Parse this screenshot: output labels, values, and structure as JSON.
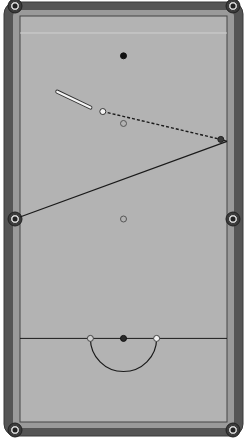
{
  "diagram": {
    "colors": {
      "background": "#ffffff",
      "rail": "#555555",
      "rail_edge": "#3a3a3a",
      "cushion": "#9a9a9a",
      "cloth": "#b3b3b3",
      "line": "#1a1a1a",
      "pocket_ring": "#d8d8d8",
      "pocket_hole": "#222222"
    },
    "table_units": {
      "width": 100,
      "length": 200
    },
    "pockets": [
      {
        "name": "top-left",
        "x": 0,
        "y": 0
      },
      {
        "name": "top-right",
        "x": 100,
        "y": 0
      },
      {
        "name": "middle-left",
        "x": 0,
        "y": 100
      },
      {
        "name": "middle-right",
        "x": 100,
        "y": 100
      },
      {
        "name": "bottom-left",
        "x": 0,
        "y": 200
      },
      {
        "name": "bottom-right",
        "x": 100,
        "y": 200
      }
    ],
    "baulk_line_y": 160,
    "d_radius": 16,
    "balls": [
      {
        "name": "black-spot-ball",
        "x": 50,
        "y": 18,
        "fill": "#111111",
        "stroke": "#111111"
      },
      {
        "name": "cue-ball",
        "x": 40,
        "y": 46,
        "fill": "#f2f2f2",
        "stroke": "#333333"
      },
      {
        "name": "pink-spot",
        "x": 50,
        "y": 52,
        "fill": "#b3b3b3",
        "stroke": "#555555"
      },
      {
        "name": "object-ball",
        "x": 97,
        "y": 60,
        "fill": "#3a3a3a",
        "stroke": "#222222"
      },
      {
        "name": "blue-spot",
        "x": 50,
        "y": 100,
        "fill": "#b3b3b3",
        "stroke": "#555555"
      },
      {
        "name": "yellow-spot",
        "x": 34,
        "y": 160,
        "fill": "#cfcfcf",
        "stroke": "#444444"
      },
      {
        "name": "brown-spot",
        "x": 50,
        "y": 160,
        "fill": "#2a2a2a",
        "stroke": "#111111"
      },
      {
        "name": "green-spot",
        "x": 66,
        "y": 160,
        "fill": "#f2f2f2",
        "stroke": "#444444"
      }
    ],
    "cue": {
      "x1": 18,
      "y1": 36,
      "x2": 34,
      "y2": 44
    },
    "aim_line": {
      "x1": 40,
      "y1": 46,
      "x2": 97,
      "y2": 60,
      "style": "dashed"
    },
    "path_lines": [
      {
        "x1": 97,
        "y1": 60,
        "x2": 100,
        "y2": 61
      },
      {
        "x1": 100,
        "y1": 61,
        "x2": 0,
        "y2": 99
      }
    ]
  }
}
